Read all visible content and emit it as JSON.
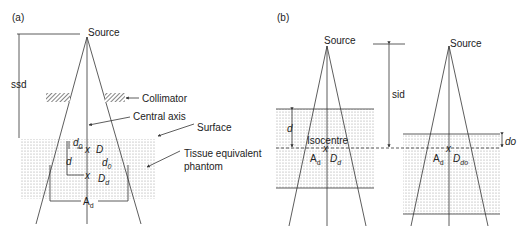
{
  "panel_a": {
    "label": "(a)",
    "source": "Source",
    "ssd": "ssd",
    "collimator": "Collimator",
    "central_axis": "Central axis",
    "surface": "Surface",
    "phantom_line1": "Tissue equivalent",
    "phantom_line2": "phantom",
    "d0": "d",
    "d0_sub": "0",
    "d": "d",
    "D": "D",
    "d0_right": "d",
    "d0_right_sub": "0",
    "x1": "x",
    "x2": "x",
    "Dd": "D",
    "Dd_sub": "d",
    "Ad": "A",
    "Ad_sub": "d"
  },
  "panel_b": {
    "label": "(b)",
    "source_left": "Source",
    "source_right": "Source",
    "sid": "sid",
    "d": "d",
    "isocentre": "Isocentre",
    "x_left": "x",
    "Ad_left": "A",
    "Ad_left_sub": "d",
    "Dd": "D",
    "Dd_sub": "d",
    "do": "do",
    "x_right": "x",
    "Ad_right": "A",
    "Ad_right_sub": "d",
    "Ddo": "D",
    "Ddo_sub": "do"
  },
  "colors": {
    "line": "#333333",
    "phantom_dots": "#9a9a9a",
    "background": "#ffffff"
  }
}
